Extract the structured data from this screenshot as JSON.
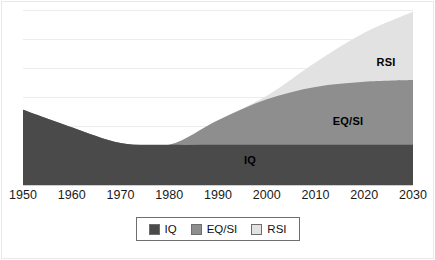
{
  "chart_data": {
    "type": "area",
    "stacked": true,
    "title": "",
    "subtitle": "",
    "xlabel": "",
    "ylabel": "",
    "grid": true,
    "gridline_count": 7,
    "legend_position": "bottom",
    "xlim": [
      1950,
      2030
    ],
    "ylim": [
      0,
      100
    ],
    "x": [
      1950,
      1960,
      1970,
      1980,
      1990,
      2000,
      2010,
      2020,
      2030
    ],
    "categories": [
      "1950",
      "1960",
      "1970",
      "1980",
      "1990",
      "2000",
      "2010",
      "2020",
      "2030"
    ],
    "series": [
      {
        "name": "IQ",
        "color": "#4a4a4a",
        "values": [
          43,
          33,
          24,
          23,
          23,
          23,
          23,
          23,
          23
        ]
      },
      {
        "name": "EQ/SI",
        "color": "#8e8e8e",
        "values": [
          0,
          0,
          0,
          0,
          14,
          26,
          33,
          36,
          37
        ]
      },
      {
        "name": "RSI",
        "color": "#e2e2e2",
        "values": [
          0,
          0,
          0,
          0,
          0,
          2,
          14,
          28,
          39
        ]
      }
    ],
    "cumulative_tops": {
      "IQ": [
        43,
        33,
        24,
        23,
        23,
        23,
        23,
        23,
        23
      ],
      "EQ/SI": [
        43,
        33,
        24,
        23,
        37,
        49,
        56,
        59,
        60
      ],
      "RSI": [
        43,
        33,
        24,
        23,
        37,
        51,
        70,
        87,
        99
      ]
    },
    "annotations": [
      {
        "text": "IQ",
        "series": "IQ",
        "x": 1997,
        "y": 11
      },
      {
        "text": "EQ/SI",
        "series": "EQ/SI",
        "x": 2017,
        "y": 44
      },
      {
        "text": "RSI",
        "series": "RSI",
        "x": 2024,
        "y": 78
      }
    ]
  },
  "axis": {
    "x_tick_labels": [
      "1950",
      "1960",
      "1970",
      "1980",
      "1990",
      "2000",
      "2010",
      "2020",
      "2030"
    ]
  },
  "legend": {
    "items": [
      {
        "label": "IQ",
        "color": "#4a4a4a"
      },
      {
        "label": "EQ/SI",
        "color": "#8e8e8e"
      },
      {
        "label": "RSI",
        "color": "#e2e2e2"
      }
    ]
  },
  "labels": {
    "iq": "IQ",
    "eqsi": "EQ/SI",
    "rsi": "RSI"
  },
  "colors": {
    "iq": "#4a4a4a",
    "eqsi": "#8e8e8e",
    "rsi": "#e2e2e2",
    "gridline": "#ececec",
    "axis": "#cfcfcf",
    "text": "#1a1a1a",
    "background": "#ffffff"
  }
}
